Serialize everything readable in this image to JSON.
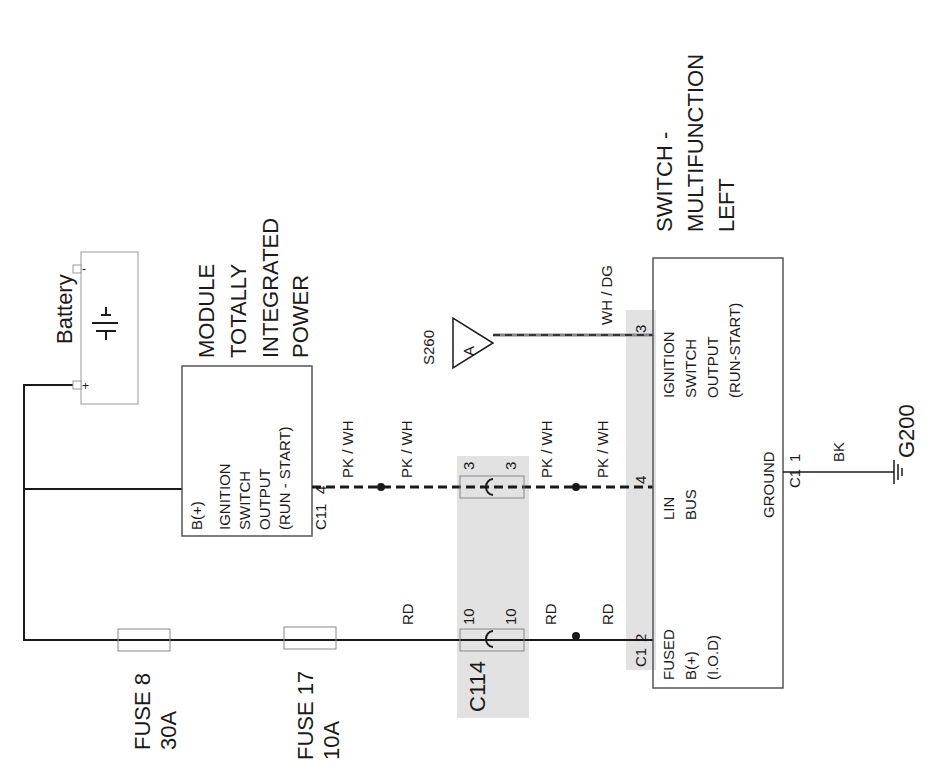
{
  "diagram": {
    "type": "wiring-schematic",
    "orientation": "rotated-90-ccw",
    "components": {
      "battery": {
        "label": "Battery",
        "positive": "+",
        "negative": "-"
      },
      "module_tipm": {
        "title": [
          "MODULE",
          "TOTALLY",
          "INTEGRATED",
          "POWER"
        ],
        "pins": [
          {
            "label": "B(+)"
          },
          {
            "label_lines": [
              "IGNITION",
              "SWITCH",
              "OUTPUT",
              "(RUN - START)"
            ],
            "connector": "C11",
            "pin": "4"
          }
        ]
      },
      "switch_multifunction_left": {
        "title": [
          "SWITCH -",
          "MULTIFUNCTION",
          "LEFT"
        ],
        "pins": [
          {
            "label_lines": [
              "FUSED",
              "B(+)",
              "(I.O.D)"
            ],
            "connector": "C1",
            "pin": "2"
          },
          {
            "label_lines": [
              "LIN",
              "BUS"
            ],
            "pin": "4"
          },
          {
            "label_lines": [
              "IGNITION",
              "SWITCH",
              "OUTPUT",
              "(RUN-START)"
            ],
            "pin": "3"
          },
          {
            "label_lines": [
              "GROUND"
            ],
            "connector": "C1",
            "pin": "1"
          }
        ]
      },
      "fuse_8": {
        "label": "FUSE 8",
        "rating": "30A"
      },
      "fuse_17": {
        "label": "FUSE 17",
        "rating": "10A"
      },
      "connector_c114": {
        "label": "C114",
        "pins": [
          "10",
          "3"
        ]
      },
      "splice_s260": {
        "label": "S260",
        "ref": "A"
      },
      "ground_g200": {
        "label": "G200"
      }
    },
    "wires": {
      "pk_wh_1": "PK / WH",
      "pk_wh_2": "PK / WH",
      "pk_wh_3": "PK / WH",
      "pk_wh_4": "PK / WH",
      "rd_1": "RD",
      "rd_2": "RD",
      "rd_3": "RD",
      "wh_dg": "WH / DG",
      "bk": "BK"
    },
    "colors": {
      "line": "#1a1a1a",
      "box": "#555555",
      "connector_shade": "#e2e2e2",
      "battery_box": "#999999"
    }
  }
}
